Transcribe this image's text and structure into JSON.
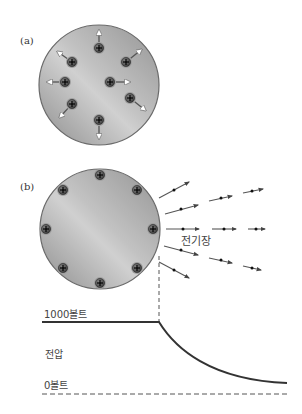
{
  "panel_a": {
    "label": "(a)",
    "sphere": {
      "cx": 99,
      "cy": 85,
      "r": 60
    },
    "charges": [
      {
        "x": 99,
        "y": 48,
        "ax": 99,
        "ay": 31
      },
      {
        "x": 72,
        "y": 62,
        "ax": 58,
        "ay": 52
      },
      {
        "x": 126,
        "y": 62,
        "ax": 141,
        "ay": 50
      },
      {
        "x": 65,
        "y": 82,
        "ax": 48,
        "ay": 82
      },
      {
        "x": 110,
        "y": 82,
        "ax": 129,
        "ay": 82
      },
      {
        "x": 130,
        "y": 98,
        "ax": 145,
        "ay": 110
      },
      {
        "x": 72,
        "y": 104,
        "ax": 60,
        "ay": 117
      },
      {
        "x": 99,
        "y": 120,
        "ax": 99,
        "ay": 138
      }
    ],
    "charge_symbol": "+"
  },
  "panel_b": {
    "label": "(b)",
    "sphere": {
      "cx": 100,
      "cy": 229,
      "r": 60
    },
    "charges": [
      {
        "x": 100,
        "y": 175
      },
      {
        "x": 63,
        "y": 190
      },
      {
        "x": 137,
        "y": 190
      },
      {
        "x": 46,
        "y": 229
      },
      {
        "x": 153,
        "y": 229
      },
      {
        "x": 63,
        "y": 268
      },
      {
        "x": 137,
        "y": 268
      },
      {
        "x": 100,
        "y": 283
      }
    ],
    "charge_symbol": "+",
    "field_label": "전기장",
    "field_segments": [
      {
        "x1": 159,
        "y1": 198,
        "x2": 189,
        "y2": 182,
        "dx": 174,
        "dy": 190
      },
      {
        "x1": 165,
        "y1": 214,
        "x2": 198,
        "y2": 205,
        "dx": 181,
        "dy": 209
      },
      {
        "x1": 209,
        "y1": 201,
        "x2": 232,
        "y2": 196,
        "dx": 221,
        "dy": 198
      },
      {
        "x1": 243,
        "y1": 193,
        "x2": 263,
        "y2": 189,
        "dx": 252,
        "dy": 191
      },
      {
        "x1": 166,
        "y1": 229,
        "x2": 199,
        "y2": 229,
        "dx": 183,
        "dy": 229
      },
      {
        "x1": 212,
        "y1": 229,
        "x2": 236,
        "y2": 229,
        "dx": 224,
        "dy": 229
      },
      {
        "x1": 248,
        "y1": 229,
        "x2": 265,
        "y2": 229,
        "dx": 256,
        "dy": 229
      },
      {
        "x1": 164,
        "y1": 246,
        "x2": 198,
        "y2": 255,
        "dx": 181,
        "dy": 250
      },
      {
        "x1": 209,
        "y1": 258,
        "x2": 232,
        "y2": 263,
        "dx": 221,
        "dy": 260
      },
      {
        "x1": 243,
        "y1": 266,
        "x2": 261,
        "y2": 270,
        "dx": 252,
        "dy": 268
      },
      {
        "x1": 159,
        "y1": 262,
        "x2": 189,
        "y2": 278,
        "dx": 174,
        "dy": 270
      }
    ]
  },
  "voltage_graph": {
    "high_label": "1000볼트",
    "axis_label": "전압",
    "zero_label": "0볼트",
    "high_voltage": 1000,
    "zero_voltage": 0,
    "unit": "볼트"
  },
  "colors": {
    "sphere_light": "#d4d4d4",
    "sphere_dark": "#8e8e8e",
    "sphere_outline": "#6a6a6a",
    "charge_fill": "#5a5a5a",
    "charge_ring": "#a0a0a0",
    "curve": "#333333",
    "field_line": "#555555",
    "arrow_head": "#ffffff"
  }
}
